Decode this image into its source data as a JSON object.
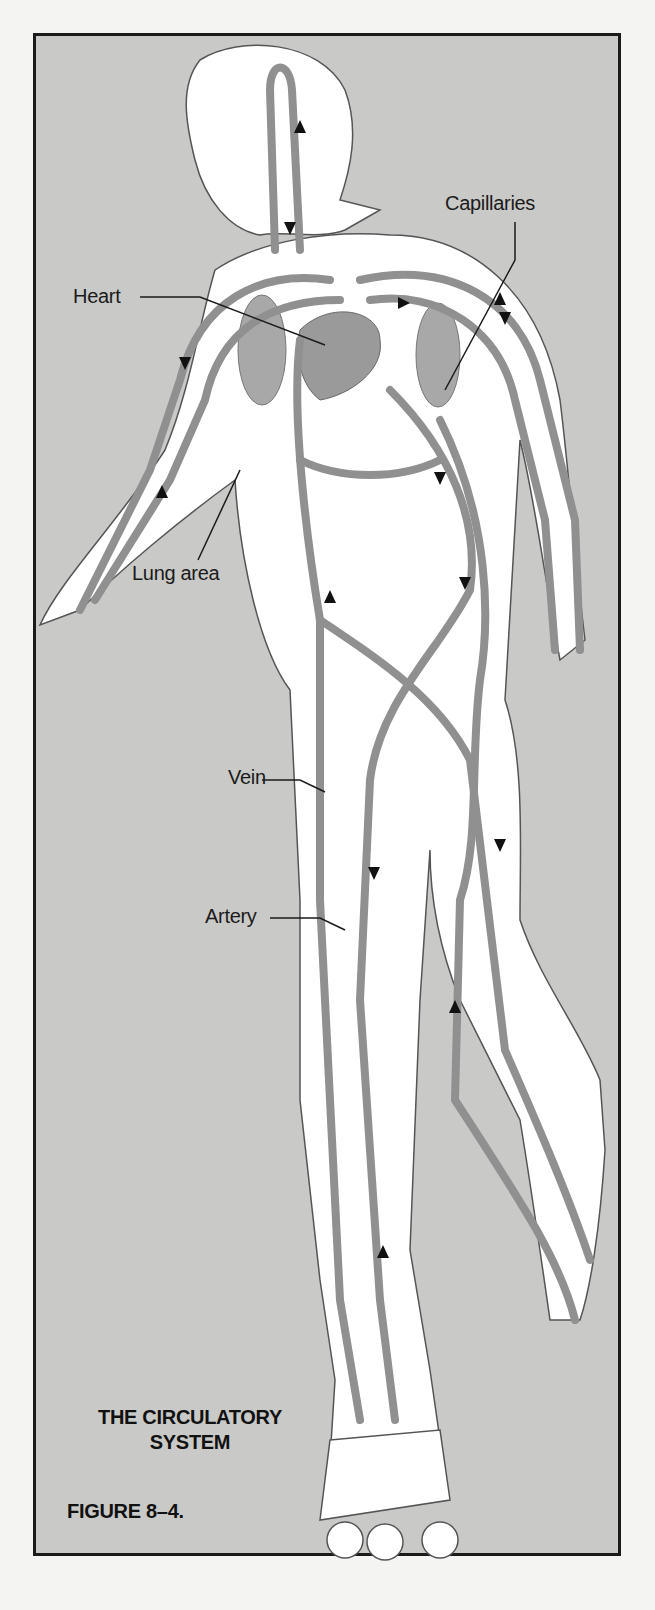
{
  "figure": {
    "title_line1": "THE CIRCULATORY",
    "title_line2": "SYSTEM",
    "caption": "FIGURE 8–4."
  },
  "labels": {
    "heart": "Heart",
    "capillaries": "Capillaries",
    "lung_area": "Lung area",
    "vein": "Vein",
    "artery": "Artery"
  },
  "colors": {
    "background": "#c9c9c7",
    "body": "#ffffff",
    "vessel": "#8f8f8f",
    "frame": "#1a1a1a"
  }
}
